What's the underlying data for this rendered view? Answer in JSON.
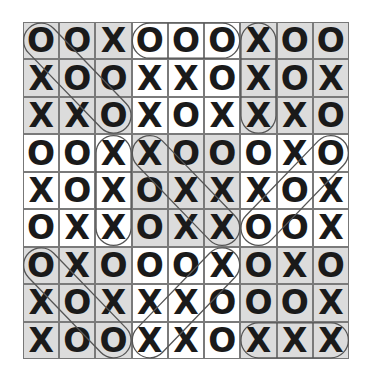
{
  "puzzle": {
    "rows": 9,
    "cols": 9,
    "grid": [
      [
        "O",
        "O",
        "X",
        "O",
        "O",
        "O",
        "X",
        "O",
        "O"
      ],
      [
        "X",
        "O",
        "O",
        "X",
        "X",
        "O",
        "X",
        "O",
        "X"
      ],
      [
        "X",
        "X",
        "O",
        "X",
        "O",
        "X",
        "X",
        "X",
        "O"
      ],
      [
        "O",
        "O",
        "X",
        "X",
        "O",
        "O",
        "O",
        "X",
        "O"
      ],
      [
        "X",
        "O",
        "X",
        "O",
        "X",
        "X",
        "X",
        "O",
        "X"
      ],
      [
        "O",
        "X",
        "X",
        "O",
        "X",
        "X",
        "O",
        "O",
        "X"
      ],
      [
        "O",
        "X",
        "O",
        "O",
        "O",
        "X",
        "O",
        "X",
        "O"
      ],
      [
        "X",
        "O",
        "X",
        "X",
        "X",
        "O",
        "O",
        "O",
        "X"
      ],
      [
        "X",
        "O",
        "O",
        "X",
        "X",
        "O",
        "X",
        "X",
        "X"
      ]
    ],
    "shaded_blocks": [
      [
        0,
        0
      ],
      [
        0,
        2
      ],
      [
        1,
        1
      ],
      [
        2,
        0
      ],
      [
        2,
        2
      ]
    ],
    "colors": {
      "shade": "#dcdcdc",
      "grid_line": "#7a7a7a",
      "mark": "#1a1a1a",
      "oval": "#555555"
    },
    "circled_lines": [
      {
        "type": "diagonal",
        "from": [
          0,
          0
        ],
        "to": [
          2,
          2
        ],
        "symbol": "O"
      },
      {
        "type": "horizontal",
        "from": [
          0,
          3
        ],
        "to": [
          0,
          5
        ],
        "symbol": "O"
      },
      {
        "type": "vertical",
        "from": [
          0,
          6
        ],
        "to": [
          2,
          6
        ],
        "symbol": "X"
      },
      {
        "type": "vertical",
        "from": [
          3,
          2
        ],
        "to": [
          5,
          2
        ],
        "symbol": "X"
      },
      {
        "type": "diagonal",
        "from": [
          3,
          3
        ],
        "to": [
          5,
          5
        ],
        "symbol": "X"
      },
      {
        "type": "anti-diagonal",
        "from": [
          3,
          8
        ],
        "to": [
          5,
          6
        ],
        "symbol": "O"
      },
      {
        "type": "diagonal",
        "from": [
          6,
          0
        ],
        "to": [
          8,
          2
        ],
        "symbol": "O"
      },
      {
        "type": "anti-diagonal",
        "from": [
          6,
          5
        ],
        "to": [
          8,
          3
        ],
        "symbol": "X"
      },
      {
        "type": "horizontal",
        "from": [
          8,
          6
        ],
        "to": [
          8,
          8
        ],
        "symbol": "X"
      }
    ]
  }
}
